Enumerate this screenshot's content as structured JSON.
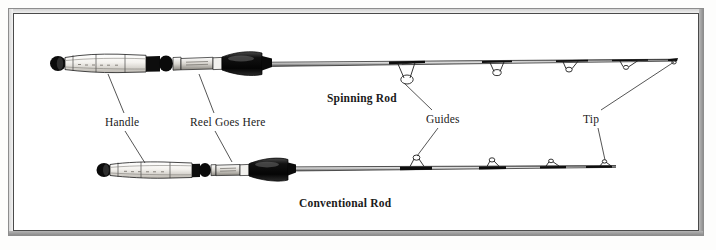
{
  "figure": {
    "background_color": "#ffffff",
    "ink_color": "#1a1a1a",
    "frame_color": "#4a4a4a"
  },
  "labels": {
    "handle": "Handle",
    "reel_goes_here": "Reel Goes Here",
    "guides": "Guides",
    "tip": "Tip",
    "spinning_rod": "Spinning Rod",
    "conventional_rod": "Conventional Rod"
  },
  "rods": [
    {
      "name": "Spinning Rod",
      "caption": "Spinning Rod",
      "guide_orientation": "below-blank",
      "parts": [
        "Handle",
        "Reel Goes Here",
        "Guides",
        "Tip"
      ],
      "guide_count": 5
    },
    {
      "name": "Conventional Rod",
      "caption": "Conventional Rod",
      "guide_orientation": "above-blank",
      "parts": [
        "Handle",
        "Reel Goes Here",
        "Guides",
        "Tip"
      ],
      "guide_count": 4
    }
  ],
  "leader_lines": [
    {
      "label": "Handle",
      "target_rod": "Spinning Rod"
    },
    {
      "label": "Handle",
      "target_rod": "Conventional Rod"
    },
    {
      "label": "Reel Goes Here",
      "target_rod": "Spinning Rod"
    },
    {
      "label": "Reel Goes Here",
      "target_rod": "Conventional Rod"
    },
    {
      "label": "Guides",
      "target_rod": "Spinning Rod"
    },
    {
      "label": "Guides",
      "target_rod": "Conventional Rod"
    },
    {
      "label": "Tip",
      "target_rod": "Spinning Rod"
    },
    {
      "label": "Tip",
      "target_rod": "Conventional Rod"
    }
  ]
}
